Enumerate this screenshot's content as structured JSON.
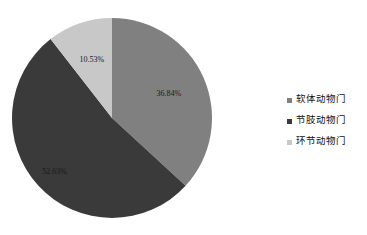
{
  "chart_data": {
    "type": "pie",
    "title": "",
    "categories": [
      "软体动物门",
      "节肢动物门",
      "环节动物门"
    ],
    "values": [
      36.84,
      52.63,
      10.53
    ],
    "value_labels": [
      "36.84%",
      "52.63%",
      "10.53%"
    ],
    "colors": [
      "#808080",
      "#3a3a3a",
      "#c8c8c8"
    ],
    "start_angle": 0,
    "direction": "clockwise",
    "legend_position": "right",
    "grid": false,
    "xlabel": "",
    "ylabel": ""
  },
  "legend": {
    "items": [
      {
        "label": "软体动物门",
        "color": "#808080"
      },
      {
        "label": "节肢动物门",
        "color": "#3a3a3a"
      },
      {
        "label": "环节动物门",
        "color": "#c8c8c8"
      }
    ]
  },
  "labels": {
    "slice1": "36.84%",
    "slice2": "52.63%",
    "slice3": "10.53%"
  },
  "colors": {
    "background": "#ffffff",
    "slice_mollusca": "#808080",
    "slice_arthropoda": "#3a3a3a",
    "slice_annelida": "#c8c8c8",
    "label_text": "#1a1a1a"
  }
}
